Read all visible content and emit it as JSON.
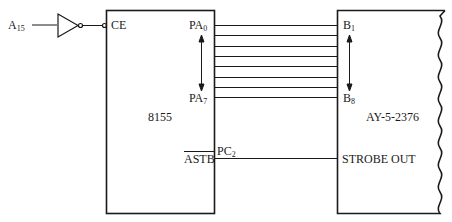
{
  "diagram": {
    "input": {
      "signal": "A",
      "subscript": "15"
    },
    "chip_8155": {
      "name": "8155",
      "pins": {
        "ce": "CE",
        "pa_start": {
          "base": "PA",
          "sub": "0"
        },
        "pa_end": {
          "base": "PA",
          "sub": "7"
        },
        "pc": {
          "base": "PC",
          "sub": "2"
        },
        "astb": "ASTB"
      }
    },
    "chip_ay": {
      "name": "AY-5-2376",
      "pins": {
        "b_start": {
          "base": "B",
          "sub": "1"
        },
        "b_end": {
          "base": "B",
          "sub": "8"
        },
        "strobe": "STROBE OUT"
      }
    },
    "bus_line_count": 8,
    "line_color": "#1a1a1a"
  }
}
